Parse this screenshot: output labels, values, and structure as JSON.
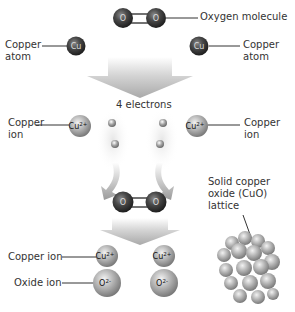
{
  "diagram": {
    "labels": {
      "oxygen_molecule": "Oxygen molecule",
      "copper_atom_left": "Copper\natom",
      "copper_atom_right": "Copper\natom",
      "electrons": "4 electrons",
      "copper_ion_left": "Copper\nion",
      "copper_ion_right": "Copper\nion",
      "solid_lattice": "Solid copper\noxide (CuO)\nlattice",
      "copper_ion_bottom": "Copper ion",
      "oxide_ion_bottom": "Oxide ion"
    },
    "symbols": {
      "oxygen": "O",
      "copper": "Cu",
      "copper_ion": "Cu²⁺",
      "copper_ion_base": "Cu",
      "copper_ion_charge": "2+",
      "oxide_ion_base": "O",
      "oxide_ion_charge": "2-"
    },
    "colors": {
      "dark_atom": "#3a3a3a",
      "ion_gray": "#a8a8a8",
      "electron": "#9a9a9a",
      "arrow": "#b8b8b8",
      "leader_line": "#333333"
    }
  }
}
